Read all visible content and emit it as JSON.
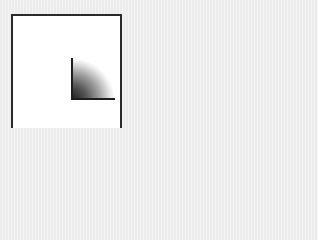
{
  "icon": {
    "name": "radial-gradient-quarter-icon",
    "colors": {
      "background": "#ececec",
      "frame_border": "#2a2a2a",
      "frame_fill": "#ffffff",
      "gradient_dark": "#1a1a1a",
      "gradient_light": "#ffffff",
      "axis": "#1e1e1e"
    }
  }
}
